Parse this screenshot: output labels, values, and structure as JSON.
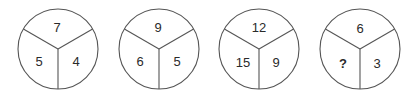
{
  "puzzle": {
    "circles": [
      {
        "top": "7",
        "left": "5",
        "right": "4"
      },
      {
        "top": "9",
        "left": "6",
        "right": "5"
      },
      {
        "top": "12",
        "left": "15",
        "right": "9"
      },
      {
        "top": "6",
        "left": "?",
        "right": "3"
      }
    ]
  },
  "colors": {
    "stroke": "#555555",
    "text": "#2a2a2a",
    "background": "#ffffff"
  }
}
